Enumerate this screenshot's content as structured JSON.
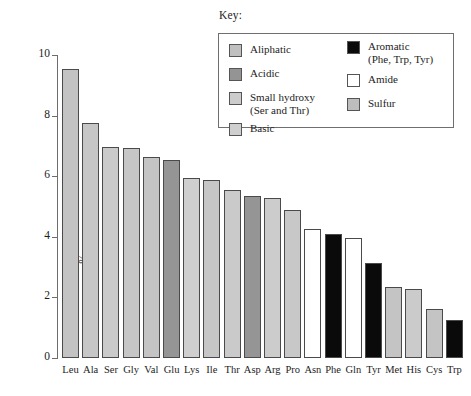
{
  "key": {
    "title": "Key:",
    "entries_left": [
      {
        "label": "Aliphatic",
        "color": "#c0c0c0",
        "icon": "legend-swatch"
      },
      {
        "label": "Acidic",
        "color": "#949494",
        "icon": "legend-swatch"
      },
      {
        "label": "Small hydroxy\n(Ser and Thr)",
        "color": "#cccccc",
        "icon": "legend-swatch"
      },
      {
        "label": "Basic",
        "color": "#cfcfcf",
        "icon": "legend-swatch"
      }
    ],
    "entries_right": [
      {
        "label": "Aromatic\n(Phe, Trp, Tyr)",
        "color": "#0a0a0a",
        "icon": "legend-swatch"
      },
      {
        "label": "Amide",
        "color": "#ffffff",
        "icon": "legend-swatch"
      },
      {
        "label": "Sulfur",
        "color": "#bdbdbd",
        "icon": "legend-swatch"
      }
    ]
  },
  "chart_data": {
    "type": "bar",
    "title": "",
    "xlabel": "",
    "ylabel": "%",
    "ylim": [
      0,
      10
    ],
    "ytick_labels": [
      "0",
      "2",
      "4",
      "6",
      "8",
      "10"
    ],
    "yticks": [
      0,
      2,
      4,
      6,
      8,
      10
    ],
    "grid": false,
    "legend_position": "top-right",
    "categories": [
      "Leu",
      "Ala",
      "Ser",
      "Gly",
      "Val",
      "Glu",
      "Lys",
      "Ile",
      "Thr",
      "Asp",
      "Arg",
      "Pro",
      "Asn",
      "Phe",
      "Gln",
      "Tyr",
      "Met",
      "His",
      "Cys",
      "Trp"
    ],
    "values": [
      9.55,
      7.75,
      6.98,
      6.93,
      6.65,
      6.55,
      5.95,
      5.88,
      5.55,
      5.35,
      5.28,
      4.9,
      4.27,
      4.1,
      3.95,
      3.15,
      2.35,
      2.28,
      1.62,
      1.25
    ],
    "bar_categories": [
      "Aliphatic",
      "Aliphatic",
      "Small hydroxy",
      "Aliphatic",
      "Aliphatic",
      "Acidic",
      "Basic",
      "Aliphatic",
      "Small hydroxy",
      "Acidic",
      "Basic",
      "Aliphatic",
      "Amide",
      "Aromatic",
      "Amide",
      "Aromatic",
      "Sulfur",
      "Basic",
      "Sulfur",
      "Aromatic"
    ],
    "bar_colors": [
      "#c3c3c3",
      "#c6c6c6",
      "#cacaca",
      "#c6c6c6",
      "#c4c4c4",
      "#959595",
      "#cfcfcf",
      "#c6c6c6",
      "#cacaca",
      "#959595",
      "#cccccc",
      "#c8c8c8",
      "#ffffff",
      "#0a0a0a",
      "#ffffff",
      "#0a0a0a",
      "#c4c4c4",
      "#cbcbcb",
      "#c4c4c4",
      "#0a0a0a"
    ]
  }
}
